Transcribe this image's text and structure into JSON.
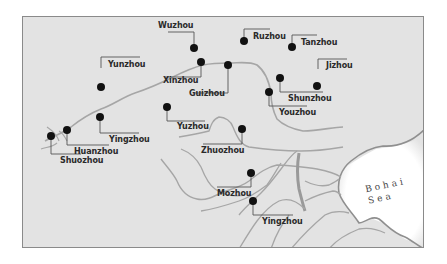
{
  "map": {
    "colors": {
      "land": "#e3e3e3",
      "river": "#a6a6a6",
      "leader": "#555555",
      "marker": "#111111",
      "sea": "#ffffff",
      "frame": "#8a8a8a"
    },
    "sea": {
      "line1": "Bohai",
      "line2": "Sea"
    },
    "places": [
      {
        "name": "Wuzhou"
      },
      {
        "name": "Ruzhou"
      },
      {
        "name": "Tanzhou"
      },
      {
        "name": "Yunzhou"
      },
      {
        "name": "Xinzhou"
      },
      {
        "name": "Guizhou"
      },
      {
        "name": "Jizhou"
      },
      {
        "name": "Shunzhou"
      },
      {
        "name": "Youzhou"
      },
      {
        "name": "Yuzhou"
      },
      {
        "name": "Yingzhou"
      },
      {
        "name": "Huanzhou"
      },
      {
        "name": "Shuozhou"
      },
      {
        "name": "Zhuozhou"
      },
      {
        "name": "Mozhou"
      },
      {
        "name": "Yingzhou"
      }
    ]
  }
}
